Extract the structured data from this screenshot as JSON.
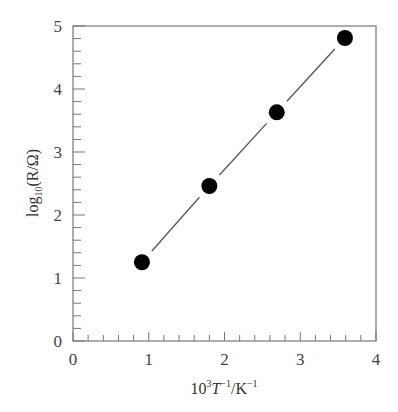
{
  "chart_data": {
    "type": "scatter",
    "title": "",
    "xlabel": "10^3 T^-1 / K^-1",
    "ylabel": "log10(R/Ω)",
    "xlim": [
      0,
      4
    ],
    "ylim": [
      0,
      5
    ],
    "x_ticks": [
      "0",
      "1",
      "2",
      "3",
      "4"
    ],
    "y_ticks": [
      "0",
      "1",
      "2",
      "3",
      "4",
      "5"
    ],
    "minor_tick_step": 0.2,
    "grid": false,
    "legend": null,
    "series": [
      {
        "name": "data",
        "marker": "filled-circle",
        "color": "#000000",
        "x": [
          0.91,
          1.8,
          2.69,
          3.59
        ],
        "y": [
          1.25,
          2.46,
          3.63,
          4.81
        ]
      }
    ],
    "fit_line": {
      "style": "solid-broken-at-markers",
      "color": "#555555",
      "from": [
        0.91,
        1.25
      ],
      "to": [
        3.59,
        4.81
      ]
    }
  },
  "labels": {
    "x_axis_main": "10",
    "x_axis_sup1": "3",
    "x_axis_T": "T",
    "x_axis_sup2": "−1",
    "x_axis_unit": "/K",
    "x_axis_sup3": "−1",
    "y_axis_log": "log",
    "y_axis_sub": "10",
    "y_axis_rest": "(R/Ω)"
  }
}
